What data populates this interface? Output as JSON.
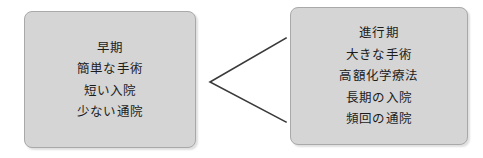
{
  "diagram": {
    "title": "",
    "background_color": "#ffffff",
    "box_fill_color": "#d5d5d5",
    "box_border_color": "#a9a9a9",
    "text_color": "#1c1c1c",
    "connector_color": "#3a3a3a",
    "boxes": [
      {
        "id": "early",
        "name": "early-stage-box",
        "lines": [
          "早期",
          "簡単な手術",
          "短い入院",
          "少ない通院"
        ]
      },
      {
        "id": "advanced",
        "name": "advanced-stage-box",
        "lines": [
          "進行期",
          "大きな手術",
          "高額化学療法",
          "長期の入院",
          "頻回の通院"
        ]
      }
    ],
    "connector": {
      "shape": "chevron-left",
      "vertex": {
        "x": 210,
        "y": 82
      },
      "upper_end": {
        "x": 286,
        "y": 38
      },
      "lower_end": {
        "x": 286,
        "y": 122
      },
      "stroke_width": 1.6
    }
  }
}
